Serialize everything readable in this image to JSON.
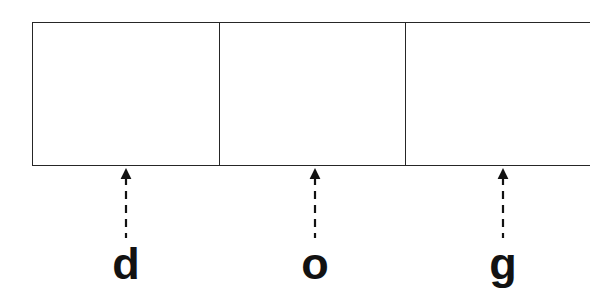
{
  "canvas": {
    "width": 614,
    "height": 293,
    "background_color": "#ffffff",
    "stroke_color": "#262626",
    "text_color": "#121212"
  },
  "diagram": {
    "type": "segmented-box-with-pointers",
    "box": {
      "x": 32,
      "y": 22,
      "width": 558,
      "height": 144,
      "border_color": "#262626",
      "fill_color": "#ffffff",
      "cell_count": 3,
      "divider_positions_px": [
        218,
        404
      ],
      "cells": [
        {
          "id": "cell-1",
          "text": "",
          "center_x": 125
        },
        {
          "id": "cell-2",
          "text": "",
          "center_x": 311
        },
        {
          "id": "cell-3",
          "text": "",
          "center_x": 497
        }
      ]
    },
    "pointers": [
      {
        "id": "pointer-d",
        "label": "d",
        "target_cell": "cell-1",
        "x": 126,
        "arrow_tip_y": 166,
        "stem_bottom_y": 240,
        "style": "dashed",
        "direction": "up",
        "color": "#121212"
      },
      {
        "id": "pointer-o",
        "label": "o",
        "target_cell": "cell-2",
        "x": 315,
        "arrow_tip_y": 166,
        "stem_bottom_y": 240,
        "style": "dashed",
        "direction": "up",
        "color": "#121212"
      },
      {
        "id": "pointer-g",
        "label": "g",
        "target_cell": "cell-3",
        "x": 503,
        "arrow_tip_y": 166,
        "stem_bottom_y": 240,
        "style": "dashed",
        "direction": "up",
        "color": "#121212"
      }
    ]
  }
}
